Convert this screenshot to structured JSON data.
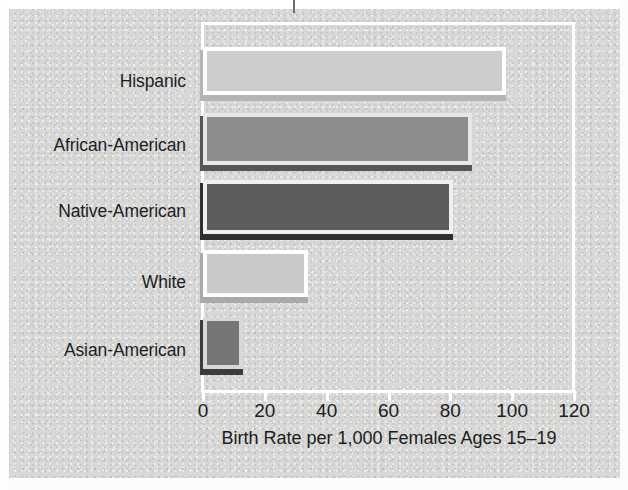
{
  "chart_data": {
    "type": "bar",
    "orientation": "horizontal",
    "title": "",
    "categories": [
      "Hispanic",
      "African-American",
      "Native-American",
      "White",
      "Asian-American"
    ],
    "values": [
      98,
      87,
      81,
      34,
      13
    ],
    "xlabel": "Birth Rate per 1,000 Females Ages 15–19",
    "ylabel": "",
    "xlim": [
      0,
      120
    ],
    "xticks": [
      0,
      20,
      40,
      60,
      80,
      100,
      120
    ],
    "xtick_labels": [
      "0",
      "20",
      "40",
      "60",
      "80",
      "100",
      "120"
    ],
    "grid": false,
    "legend": false,
    "bar_styles": [
      {
        "category": "Hispanic",
        "fill": "#cdcdcd",
        "border": "#ffffff",
        "shadow": "#b4b4b4"
      },
      {
        "category": "African-American",
        "fill": "#8e8e8e",
        "border": "#e8e8e8",
        "shadow": "#565656"
      },
      {
        "category": "Native-American",
        "fill": "#5d5d5d",
        "border": "#f0f0f0",
        "shadow": "#2f2f2f"
      },
      {
        "category": "White",
        "fill": "#c9c9c9",
        "border": "#ffffff",
        "shadow": "#aaaaaa"
      },
      {
        "category": "Asian-American",
        "fill": "#757575",
        "border": "#d8d8d8",
        "shadow": "#3c3c3c"
      }
    ]
  },
  "axis": {
    "title": "Birth Rate per 1,000 Females Ages 15–19",
    "ticks": [
      "0",
      "20",
      "40",
      "60",
      "80",
      "100",
      "120"
    ]
  },
  "categories": {
    "c0": "Hispanic",
    "c1": "African-American",
    "c2": "Native-American",
    "c3": "White",
    "c4": "Asian-American"
  },
  "colors": {
    "page_background": "#d8d8d7",
    "frame": "#ffffff",
    "text": "#1c1c1c"
  }
}
